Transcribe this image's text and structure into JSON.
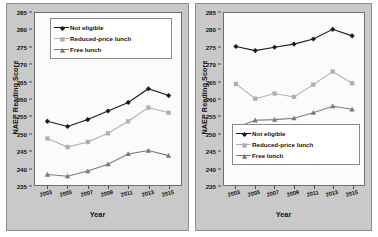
{
  "figure": {
    "panels": [
      {
        "id": "left-panel",
        "ytitle": "NAEP Reading Score",
        "xtitle": "Year",
        "legend_position": "top-left"
      },
      {
        "id": "right-panel",
        "ytitle": "NAEP Reading Score",
        "xtitle": "Year",
        "legend_position": "bottom-left"
      }
    ]
  },
  "series_colors": {
    "not_eligible": "#1a1a1a",
    "reduced_price_lunch": "#b0b0b0",
    "free_lunch": "#7a7a7a",
    "panel_background": "#c9c9c9",
    "plot_background": "#fbfbfb",
    "axis": "#6f6f6f"
  },
  "chart_data": [
    {
      "type": "line",
      "title": "",
      "xlabel": "Year",
      "ylabel": "NAEP Reading Score",
      "categories": [
        "2003",
        "2005",
        "2007",
        "2009",
        "2011",
        "2013",
        "2015"
      ],
      "x": [
        2003,
        2005,
        2007,
        2009,
        2011,
        2013,
        2015
      ],
      "ylim": [
        235,
        285
      ],
      "yticks": [
        235,
        240,
        245,
        250,
        255,
        260,
        265,
        270,
        275,
        280,
        285
      ],
      "grid": false,
      "legend": "top-left",
      "series": [
        {
          "name": "Not eligible",
          "marker": "diamond",
          "color": "#1a1a1a",
          "values": [
            253.5,
            252.0,
            254.0,
            256.5,
            259.0,
            263.0,
            261.0
          ]
        },
        {
          "name": "Reduced-price lunch",
          "marker": "square",
          "color": "#b0b0b0",
          "values": [
            248.5,
            246.0,
            247.5,
            250.0,
            253.5,
            257.5,
            256.0
          ]
        },
        {
          "name": "Free lunch",
          "marker": "triangle",
          "color": "#7a7a7a",
          "values": [
            238.0,
            237.5,
            239.0,
            241.0,
            244.0,
            245.0,
            243.5
          ]
        }
      ]
    },
    {
      "type": "line",
      "title": "",
      "xlabel": "Year",
      "ylabel": "NAEP Reading Score",
      "categories": [
        "2003",
        "2005",
        "2007",
        "2009",
        "2011",
        "2013",
        "2015"
      ],
      "x": [
        2003,
        2005,
        2007,
        2009,
        2011,
        2013,
        2015
      ],
      "ylim": [
        235,
        285
      ],
      "yticks": [
        235,
        240,
        245,
        250,
        255,
        260,
        265,
        270,
        275,
        280,
        285
      ],
      "grid": false,
      "legend": "bottom-left",
      "series": [
        {
          "name": "Not eligible",
          "marker": "diamond",
          "color": "#1a1a1a",
          "values": [
            275.3,
            274.1,
            275.1,
            276.0,
            277.5,
            280.3,
            278.4
          ]
        },
        {
          "name": "Reduced-price lunch",
          "marker": "square",
          "color": "#b0b0b0",
          "values": [
            264.4,
            260.1,
            261.6,
            260.6,
            264.2,
            268.0,
            264.6
          ]
        },
        {
          "name": "Free lunch",
          "marker": "triangle",
          "color": "#7a7a7a",
          "values": [
            251.7,
            253.8,
            254.0,
            254.4,
            256.0,
            257.9,
            257.0
          ]
        }
      ]
    }
  ]
}
